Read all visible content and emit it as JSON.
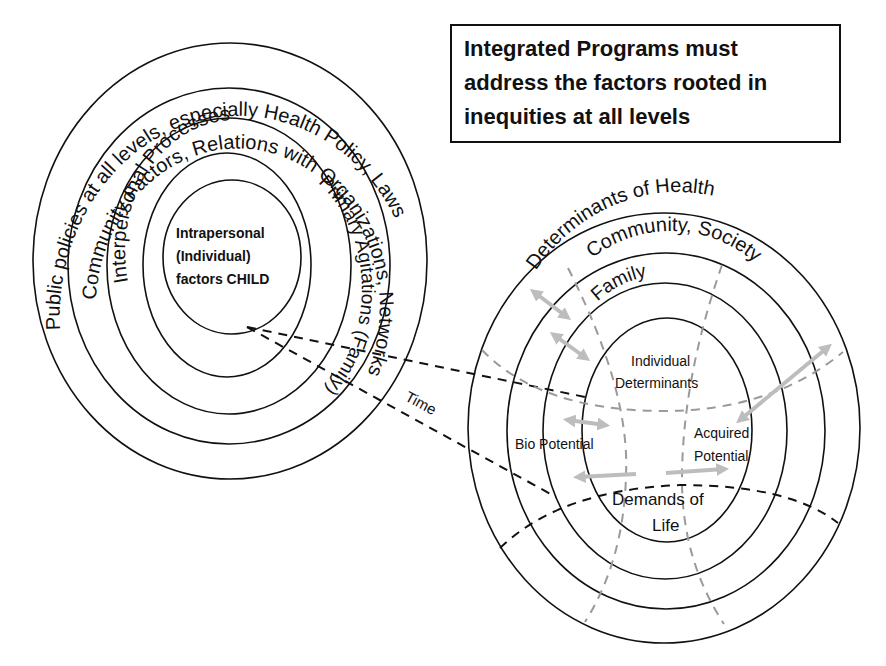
{
  "callout": {
    "lines": [
      "Integrated Programs must",
      "address the factors rooted in",
      "inequities at all levels"
    ]
  },
  "left_diagram": {
    "rings": [
      {
        "label": "Public policies at all levels, especially Health Policy, Laws"
      },
      {
        "label": "Community Factors, Relations with Organizations, Networks"
      },
      {
        "label": "Interpersonal Processes"
      },
      {
        "label": "Primary Agitations (Family)"
      }
    ],
    "center": {
      "lines": [
        "Intrapersonal",
        "(Individual)",
        "factors CHILD"
      ]
    },
    "time_label": "Time"
  },
  "right_diagram": {
    "rings": [
      {
        "label": "Determinants of Health"
      },
      {
        "label": "Community, Society"
      },
      {
        "label": "Family"
      }
    ],
    "center": {
      "lines": [
        "Individual",
        "Determinants"
      ]
    },
    "bio_potential": "Bio Potential",
    "acquired_potential": [
      "Acquired",
      "Potential"
    ],
    "demands_of_life": [
      "Demands of",
      "Life"
    ]
  },
  "colors": {
    "line": "#111111",
    "gray_dash": "#9a9a9a",
    "gray_arrow": "#bdbdbd",
    "background": "#ffffff"
  }
}
